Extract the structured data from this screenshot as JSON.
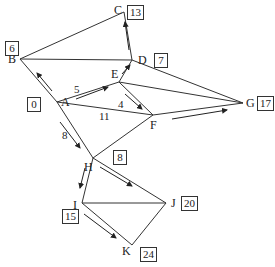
{
  "diagram": {
    "type": "shortest-path network",
    "nodes": [
      {
        "id": "A",
        "x": 57,
        "y": 102,
        "label": "A",
        "dist": "0"
      },
      {
        "id": "B",
        "x": 20,
        "y": 59,
        "label": "B",
        "dist": "6"
      },
      {
        "id": "C",
        "x": 124,
        "y": 12,
        "label": "C",
        "dist": "13"
      },
      {
        "id": "D",
        "x": 132,
        "y": 60,
        "label": "D",
        "dist": "7"
      },
      {
        "id": "E",
        "x": 119,
        "y": 82,
        "label": "E",
        "dist": ""
      },
      {
        "id": "F",
        "x": 153,
        "y": 115,
        "label": "F",
        "dist": ""
      },
      {
        "id": "G",
        "x": 243,
        "y": 103,
        "label": "G",
        "dist": "17"
      },
      {
        "id": "H",
        "x": 93,
        "y": 158,
        "label": "H",
        "dist": "8"
      },
      {
        "id": "I",
        "x": 82,
        "y": 203,
        "label": "I",
        "dist": "15"
      },
      {
        "id": "J",
        "x": 166,
        "y": 203,
        "label": "J",
        "dist": "20"
      },
      {
        "id": "K",
        "x": 132,
        "y": 245,
        "label": "K",
        "dist": "24"
      }
    ],
    "edges": [
      [
        "A",
        "B"
      ],
      [
        "A",
        "E"
      ],
      [
        "A",
        "F"
      ],
      [
        "A",
        "H"
      ],
      [
        "B",
        "C"
      ],
      [
        "B",
        "D"
      ],
      [
        "C",
        "D"
      ],
      [
        "D",
        "E"
      ],
      [
        "D",
        "G"
      ],
      [
        "E",
        "F"
      ],
      [
        "E",
        "G"
      ],
      [
        "F",
        "G"
      ],
      [
        "F",
        "H"
      ],
      [
        "H",
        "I"
      ],
      [
        "H",
        "J"
      ],
      [
        "I",
        "J"
      ],
      [
        "I",
        "K"
      ],
      [
        "J",
        "K"
      ]
    ],
    "path_edges": [
      [
        "A",
        "B"
      ],
      [
        "A",
        "E"
      ],
      [
        "A",
        "H"
      ],
      [
        "E",
        "D"
      ],
      [
        "D",
        "C"
      ],
      [
        "E",
        "F"
      ],
      [
        "H",
        "I"
      ],
      [
        "H",
        "J"
      ],
      [
        "I",
        "K"
      ]
    ],
    "weights": [
      {
        "text": "5",
        "x": 74,
        "y": 84
      },
      {
        "text": "4",
        "x": 118,
        "y": 99
      },
      {
        "text": "11",
        "x": 99,
        "y": 111
      },
      {
        "text": "8",
        "x": 62,
        "y": 130
      }
    ],
    "arrows": [
      {
        "from": "A",
        "to": "B",
        "x1": 52,
        "y1": 91,
        "x2": 37,
        "y2": 73
      },
      {
        "from": "A",
        "to": "E",
        "x1": 76,
        "y1": 99,
        "x2": 108,
        "y2": 87
      },
      {
        "from": "E",
        "to": "F",
        "x1": 125,
        "y1": 94,
        "x2": 142,
        "y2": 109
      },
      {
        "from": "A",
        "to": "H",
        "x1": 60,
        "y1": 122,
        "x2": 80,
        "y2": 148
      },
      {
        "from": "E",
        "to": "D",
        "x1": 122,
        "y1": 74,
        "x2": 130,
        "y2": 65
      },
      {
        "from": "D",
        "to": "C",
        "x1": 129,
        "y1": 50,
        "x2": 125,
        "y2": 22
      },
      {
        "from": "F",
        "to": "G",
        "x1": 172,
        "y1": 119,
        "x2": 227,
        "y2": 110
      },
      {
        "from": "H",
        "to": "I",
        "x1": 85,
        "y1": 168,
        "x2": 80,
        "y2": 188
      },
      {
        "from": "H",
        "to": "J",
        "x1": 100,
        "y1": 167,
        "x2": 132,
        "y2": 186
      },
      {
        "from": "I",
        "to": "K",
        "x1": 84,
        "y1": 214,
        "x2": 116,
        "y2": 238
      }
    ],
    "dist_boxes": [
      {
        "node": "A",
        "text": "0",
        "x": 27,
        "y": 97
      },
      {
        "node": "B",
        "text": "6",
        "x": 5,
        "y": 41
      },
      {
        "node": "C",
        "text": "13",
        "x": 127,
        "y": 5
      },
      {
        "node": "D",
        "text": "7",
        "x": 154,
        "y": 53
      },
      {
        "node": "G",
        "text": "17",
        "x": 257,
        "y": 96
      },
      {
        "node": "H",
        "text": "8",
        "x": 113,
        "y": 150
      },
      {
        "node": "I",
        "text": "15",
        "x": 62,
        "y": 209
      },
      {
        "node": "J",
        "text": "20",
        "x": 181,
        "y": 196
      },
      {
        "node": "K",
        "text": "24",
        "x": 140,
        "y": 247
      }
    ]
  }
}
